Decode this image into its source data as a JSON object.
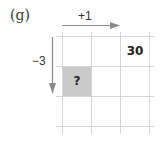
{
  "figure": {
    "label": "(g)",
    "horizontal_arrow": {
      "label": "+1",
      "direction": "right"
    },
    "vertical_arrow": {
      "label": "−3",
      "direction": "down"
    },
    "grid": {
      "rows": 3,
      "cols": 3,
      "cells": [
        {
          "row": 0,
          "col": 2,
          "text": "30",
          "highlighted": false
        },
        {
          "row": 1,
          "col": 0,
          "text": "?",
          "highlighted": true
        }
      ]
    },
    "colors": {
      "grid_line": "#d6d6d6",
      "arrow": "#8a8a8a",
      "highlight": "#c9c9c9",
      "text": "#222222"
    }
  }
}
